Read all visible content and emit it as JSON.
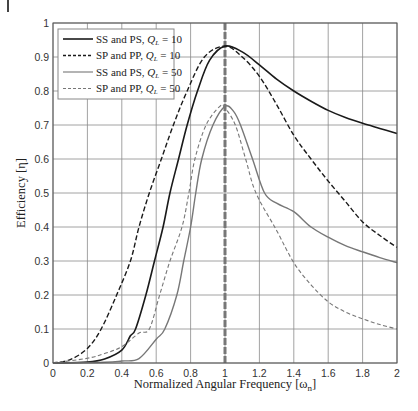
{
  "chart_data": {
    "type": "line",
    "title": "",
    "xlabel": "Normalized Angular Frequency [ω_n]",
    "xlabel_main": "Normalized Angular Frequency [ω",
    "xlabel_sub": "n",
    "xlabel_end": "]",
    "ylabel": "Efficiency [η]",
    "xlim": [
      0,
      2
    ],
    "ylim": [
      0,
      1
    ],
    "xticks": [
      0,
      0.2,
      0.4,
      0.6,
      0.8,
      1,
      1.2,
      1.4,
      1.6,
      1.8,
      2
    ],
    "xtick_labels": [
      "0",
      "0.2",
      "0.4",
      "0.6",
      "0.8",
      "1",
      "1.2",
      "1.4",
      "1.6",
      "1.8",
      "2"
    ],
    "yticks": [
      0,
      0.1,
      0.2,
      0.3,
      0.4,
      0.5,
      0.6,
      0.7,
      0.8,
      0.9,
      1
    ],
    "ytick_labels": [
      "0",
      "0.1",
      "0.2",
      "0.3",
      "0.4",
      "0.5",
      "0.6",
      "0.7",
      "0.8",
      "0.9",
      "1"
    ],
    "grid": true,
    "legend_position": "top-left",
    "reference_line": {
      "x": 1,
      "style": "dashed",
      "color": "#777777"
    },
    "series": [
      {
        "name": "SS and PS, Q_L = 10",
        "label_main": "SS and PS, ",
        "label_q": "Q",
        "label_sub": "L",
        "label_val": " = 10",
        "color": "#1a1a1a",
        "style": "solid",
        "points": [
          [
            0,
            0
          ],
          [
            0.2,
            0.003
          ],
          [
            0.3,
            0.012
          ],
          [
            0.4,
            0.038
          ],
          [
            0.45,
            0.08
          ],
          [
            0.48,
            0.1
          ],
          [
            0.54,
            0.2
          ],
          [
            0.59,
            0.3
          ],
          [
            0.64,
            0.4
          ],
          [
            0.68,
            0.5
          ],
          [
            0.73,
            0.6
          ],
          [
            0.78,
            0.7
          ],
          [
            0.84,
            0.8
          ],
          [
            0.91,
            0.89
          ],
          [
            1.0,
            0.932
          ],
          [
            1.1,
            0.915
          ],
          [
            1.2,
            0.877
          ],
          [
            1.3,
            0.835
          ],
          [
            1.4,
            0.8
          ],
          [
            1.5,
            0.77
          ],
          [
            1.6,
            0.743
          ],
          [
            1.7,
            0.722
          ],
          [
            1.8,
            0.705
          ],
          [
            1.9,
            0.69
          ],
          [
            2.0,
            0.675
          ]
        ]
      },
      {
        "name": "SP and PP, Q_L = 10",
        "label_main": "SP and PP, ",
        "label_q": "Q",
        "label_sub": "L",
        "label_val": " = 10",
        "color": "#1a1a1a",
        "style": "dashed",
        "points": [
          [
            0,
            0
          ],
          [
            0.1,
            0.01
          ],
          [
            0.2,
            0.043
          ],
          [
            0.28,
            0.1
          ],
          [
            0.37,
            0.2
          ],
          [
            0.45,
            0.3
          ],
          [
            0.5,
            0.4
          ],
          [
            0.56,
            0.5
          ],
          [
            0.63,
            0.6
          ],
          [
            0.7,
            0.7
          ],
          [
            0.78,
            0.8
          ],
          [
            0.88,
            0.9
          ],
          [
            1.0,
            0.932
          ],
          [
            1.1,
            0.9
          ],
          [
            1.2,
            0.843
          ],
          [
            1.3,
            0.76
          ],
          [
            1.4,
            0.67
          ],
          [
            1.5,
            0.6
          ],
          [
            1.6,
            0.535
          ],
          [
            1.7,
            0.475
          ],
          [
            1.8,
            0.415
          ],
          [
            1.9,
            0.375
          ],
          [
            2.0,
            0.34
          ]
        ]
      },
      {
        "name": "SS and PS, Q_L = 50",
        "label_main": "SS and PS, ",
        "label_q": "Q",
        "label_sub": "L",
        "label_val": " = 50",
        "color": "#777777",
        "style": "solid",
        "points": [
          [
            0,
            0
          ],
          [
            0.3,
            0.002
          ],
          [
            0.4,
            0.006
          ],
          [
            0.5,
            0.013
          ],
          [
            0.6,
            0.07
          ],
          [
            0.65,
            0.1
          ],
          [
            0.72,
            0.2
          ],
          [
            0.76,
            0.3
          ],
          [
            0.8,
            0.4
          ],
          [
            0.83,
            0.5
          ],
          [
            0.865,
            0.6
          ],
          [
            0.93,
            0.7
          ],
          [
            1.0,
            0.755
          ],
          [
            1.05,
            0.74
          ],
          [
            1.09,
            0.7
          ],
          [
            1.16,
            0.6
          ],
          [
            1.23,
            0.5
          ],
          [
            1.3,
            0.47
          ],
          [
            1.4,
            0.445
          ],
          [
            1.5,
            0.4
          ],
          [
            1.6,
            0.37
          ],
          [
            1.7,
            0.345
          ],
          [
            1.8,
            0.327
          ],
          [
            1.9,
            0.31
          ],
          [
            2.0,
            0.295
          ]
        ]
      },
      {
        "name": "SP and PP, Q_L = 50",
        "label_main": "SP and PP, ",
        "label_q": "Q",
        "label_sub": "L",
        "label_val": " = 50",
        "color": "#777777",
        "style": "dashed",
        "points": [
          [
            0,
            0
          ],
          [
            0.2,
            0.014
          ],
          [
            0.3,
            0.028
          ],
          [
            0.4,
            0.048
          ],
          [
            0.5,
            0.088
          ],
          [
            0.56,
            0.1
          ],
          [
            0.62,
            0.2
          ],
          [
            0.68,
            0.3
          ],
          [
            0.75,
            0.4
          ],
          [
            0.79,
            0.5
          ],
          [
            0.825,
            0.6
          ],
          [
            0.89,
            0.7
          ],
          [
            0.97,
            0.755
          ],
          [
            1.0,
            0.75
          ],
          [
            1.06,
            0.7
          ],
          [
            1.12,
            0.6
          ],
          [
            1.18,
            0.5
          ],
          [
            1.3,
            0.39
          ],
          [
            1.4,
            0.295
          ],
          [
            1.5,
            0.23
          ],
          [
            1.6,
            0.18
          ],
          [
            1.7,
            0.15
          ],
          [
            1.8,
            0.13
          ],
          [
            1.9,
            0.113
          ],
          [
            2.0,
            0.1
          ]
        ]
      }
    ]
  }
}
